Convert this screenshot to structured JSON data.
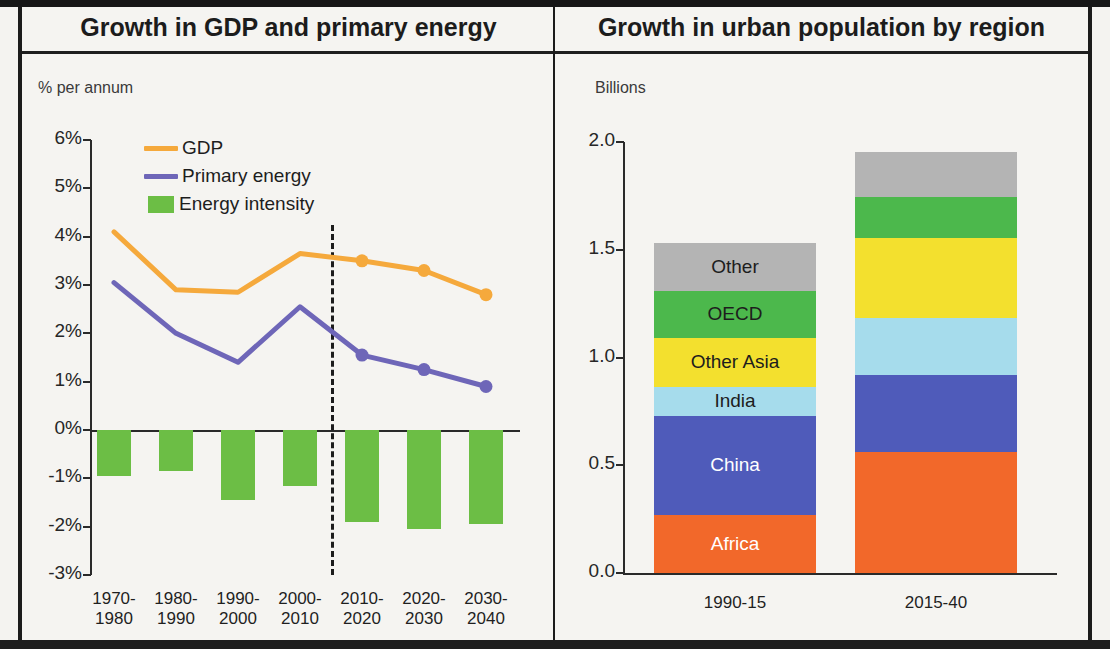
{
  "left_panel": {
    "title": "Growth in GDP and primary energy",
    "unit_label": "% per annum",
    "legend": [
      {
        "label": "GDP",
        "color": "#f5a93c",
        "marker": "line"
      },
      {
        "label": "Primary energy",
        "color": "#6e66b8",
        "marker": "line"
      },
      {
        "label": "Energy intensity",
        "color": "#6cbe45",
        "marker": "box"
      }
    ]
  },
  "right_panel": {
    "title": "Growth in urban population by region",
    "unit_label": "Billions"
  },
  "chart_data": [
    {
      "type": "line",
      "title": "Growth in GDP and primary energy",
      "xlabel": "",
      "ylabel": "% per annum",
      "ylim": [
        -3,
        6
      ],
      "ytick_labels": [
        "6%",
        "5%",
        "4%",
        "3%",
        "2%",
        "1%",
        "0%",
        "-1%",
        "-2%",
        "-3%"
      ],
      "ytick_values": [
        6,
        5,
        4,
        3,
        2,
        1,
        0,
        -1,
        -2,
        -3
      ],
      "grid": false,
      "legend_position": "top-left",
      "categories": [
        "1970-1980",
        "1980-1990",
        "1990-2000",
        "2000-2010",
        "2010-2020",
        "2020-2030",
        "2030-2040"
      ],
      "category_lines": [
        [
          "1970-",
          "1980"
        ],
        [
          "1980-",
          "1990"
        ],
        [
          "1990-",
          "2000"
        ],
        [
          "2000-",
          "2010"
        ],
        [
          "2010-",
          "2020"
        ],
        [
          "2020-",
          "2030"
        ],
        [
          "2030-",
          "2040"
        ]
      ],
      "series": [
        {
          "name": "GDP",
          "type": "line",
          "color": "#f5a93c",
          "values": [
            4.1,
            2.9,
            2.85,
            3.65,
            3.5,
            3.3,
            2.8
          ],
          "markers_from_index": 4
        },
        {
          "name": "Primary energy",
          "type": "line",
          "color": "#6e66b8",
          "values": [
            3.05,
            2.0,
            1.4,
            2.55,
            1.55,
            1.25,
            0.9
          ],
          "markers_from_index": 4
        },
        {
          "name": "Energy intensity",
          "type": "bar",
          "color": "#6cbe45",
          "values": [
            -0.95,
            -0.85,
            -1.45,
            -1.15,
            -1.9,
            -2.05,
            -1.95
          ]
        }
      ],
      "annotations": [
        {
          "type": "vertical-dashed-line",
          "between": [
            "2000-2010",
            "2010-2020"
          ],
          "meaning": "history / projection divider"
        }
      ]
    },
    {
      "type": "bar",
      "subtype": "stacked",
      "title": "Growth in urban population by region",
      "xlabel": "",
      "ylabel": "Billions",
      "ylim": [
        0,
        2.0
      ],
      "ytick_labels": [
        "2.0",
        "1.5",
        "1.0",
        "0.5",
        "0.0"
      ],
      "ytick_values": [
        2.0,
        1.5,
        1.0,
        0.5,
        0.0
      ],
      "grid": false,
      "categories": [
        "1990-15",
        "2015-40"
      ],
      "totals": [
        1.65,
        1.95
      ],
      "series": [
        {
          "name": "Africa",
          "color": "#f2682a",
          "text_color": "#ffffff",
          "values": [
            0.27,
            0.56
          ]
        },
        {
          "name": "China",
          "color": "#4f5bba",
          "text_color": "#ffffff",
          "values": [
            0.46,
            0.36
          ]
        },
        {
          "name": "India",
          "color": "#a6dcec",
          "text_color": "#1d1d1d",
          "values": [
            0.135,
            0.265
          ]
        },
        {
          "name": "Other Asia",
          "color": "#f3e02e",
          "text_color": "#1d1d1d",
          "values": [
            0.225,
            0.37
          ]
        },
        {
          "name": "OECD",
          "color": "#4cb84c",
          "text_color": "#1d1d1d",
          "values": [
            0.22,
            0.19
          ]
        },
        {
          "name": "Other",
          "color": "#b4b4b4",
          "text_color": "#1d1d1d",
          "values": [
            0.22,
            0.21
          ]
        }
      ]
    }
  ]
}
